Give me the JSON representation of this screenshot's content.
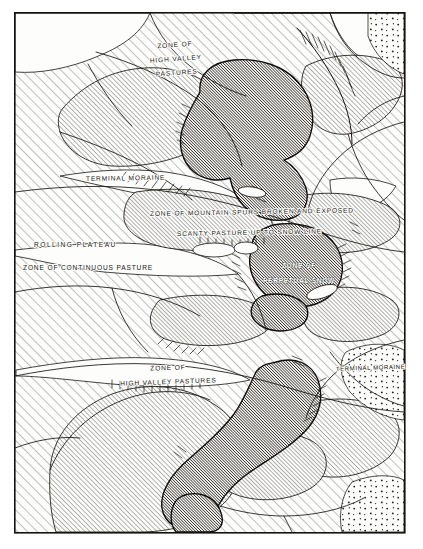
{
  "figure": {
    "kind": "physiographic-block-diagram",
    "medium": "pen-and-ink engraving",
    "paper_color": "#fdfdfb",
    "ink_color": "#14130f",
    "frame": {
      "x": 14,
      "y": 12,
      "width": 391,
      "height": 521,
      "stroke_color": "#14130f",
      "stroke_width": 1.6
    }
  },
  "legend_textures": [
    {
      "id": "rolling-plateau-hatch",
      "name": "open diagonal hatching",
      "means": "rolling plateau / continuous pasture",
      "angle_deg": 45,
      "spacing_px": 7,
      "stroke_color": "#2a2926",
      "stroke_width": 0.65
    },
    {
      "id": "valley-slope-hatch",
      "name": "medium diagonal hatching",
      "means": "high valley pastures and mountain spurs",
      "angle_deg": 45,
      "spacing_px": 3.4,
      "stroke_color": "#26251f",
      "stroke_width": 0.65
    },
    {
      "id": "perpetual-snow-hatch",
      "name": "dense diagonal hatching",
      "means": "zone of perpetual snow",
      "angle_deg": 45,
      "spacing_px": 2.0,
      "stroke_color": "#111110",
      "stroke_width": 1.15
    },
    {
      "id": "moraine-stipple",
      "name": "stipple / dot texture",
      "means": "terminal moraine deposits",
      "dot_spacing_px": 11,
      "dot_radius_px": 0.95,
      "fill_color": "#232220"
    },
    {
      "id": "hachure-comb",
      "name": "hachured ridge comb",
      "means": "steep escarpment or arete crest",
      "stroke_color": "#14130f"
    }
  ],
  "labels": [
    {
      "id": "zone-high-valley-pastures-upper",
      "lines": [
        "ZONE OF",
        "HIGH VALLEY",
        "PASTURES"
      ],
      "x": 175,
      "y": 47,
      "anchor": "middle",
      "line_height": 14,
      "style": "haloed",
      "rotation": -4
    },
    {
      "id": "terminal-moraine-upper",
      "lines": [
        "TERMINAL MORAINE"
      ],
      "x": 86,
      "y": 181,
      "anchor": "start",
      "line_height": 12,
      "style": "haloed",
      "rotation": -1
    },
    {
      "id": "zone-mountain-spurs",
      "lines": [
        "ZONE OF MOUNTAIN SPURS BROKEN AND EXPOSED"
      ],
      "x": 150,
      "y": 216,
      "anchor": "start",
      "line_height": 12,
      "style": "haloed",
      "rotation": -1
    },
    {
      "id": "scanty-pasture",
      "lines": [
        "SCANTY PASTURE UP TO SNOW LINE"
      ],
      "x": 177,
      "y": 236,
      "anchor": "start",
      "line_height": 12,
      "style": "haloed",
      "rotation": -1
    },
    {
      "id": "rolling-plateau",
      "lines": [
        "ROLLING  PLATEAU"
      ],
      "x": 34,
      "y": 247,
      "anchor": "start",
      "line_height": 12,
      "style": "haloed wide",
      "rotation": 0
    },
    {
      "id": "zone-continuous-pasture",
      "lines": [
        "ZONE OF CONTINUOUS PASTURE"
      ],
      "x": 23,
      "y": 270,
      "anchor": "start",
      "line_height": 12,
      "style": "haloed",
      "rotation": 0
    },
    {
      "id": "zone-perpetual-snow",
      "lines": [
        "ZONE OF",
        "PERPETUAL SNOW"
      ],
      "x": 299,
      "y": 268,
      "anchor": "middle",
      "line_height": 15,
      "style": "on-dark",
      "rotation": 0
    },
    {
      "id": "zone-high-valley-pastures-lower",
      "lines": [
        "ZONE          OF",
        "HIGH VALLEY PASTURES"
      ],
      "x": 168,
      "y": 370,
      "anchor": "middle",
      "line_height": 14,
      "style": "haloed",
      "rotation": -2
    },
    {
      "id": "terminal-moraine-lower",
      "lines": [
        "TERMINAL MORAINE"
      ],
      "x": 336,
      "y": 371,
      "anchor": "start",
      "line_height": 12,
      "style": "haloed small",
      "rotation": -2
    }
  ]
}
